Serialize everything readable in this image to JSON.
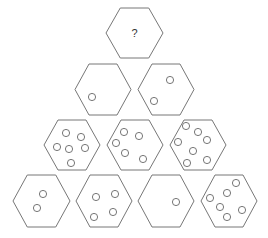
{
  "puzzle": {
    "question_mark": "?",
    "circle_radius": 3.6,
    "stroke_color": "#777777",
    "hexagons": [
      {
        "id": "top",
        "row": 1,
        "cx": 134.5,
        "cy": 33,
        "w": 57,
        "h": 50,
        "label": "?",
        "circles": []
      },
      {
        "id": "r2-1",
        "row": 2,
        "cx": 103,
        "cy": 89.5,
        "w": 56,
        "h": 51,
        "circles": [
          [
            92,
            97
          ]
        ]
      },
      {
        "id": "r2-2",
        "row": 2,
        "cx": 166,
        "cy": 89.5,
        "w": 56,
        "h": 51,
        "circles": [
          [
            170,
            80
          ],
          [
            154,
            101
          ]
        ]
      },
      {
        "id": "r3-1",
        "row": 3,
        "cx": 72,
        "cy": 145,
        "w": 56,
        "h": 50,
        "circles": [
          [
            66,
            133
          ],
          [
            81,
            137
          ],
          [
            57,
            147
          ],
          [
            69,
            149
          ],
          [
            85,
            148
          ],
          [
            71,
            163
          ]
        ]
      },
      {
        "id": "r3-2",
        "row": 3,
        "cx": 135,
        "cy": 145,
        "w": 56,
        "h": 50,
        "circles": [
          [
            124,
            132
          ],
          [
            139,
            136
          ],
          [
            116,
            143
          ],
          [
            125,
            153
          ],
          [
            143,
            159
          ]
        ]
      },
      {
        "id": "r3-3",
        "row": 3,
        "cx": 198,
        "cy": 145,
        "w": 56,
        "h": 50,
        "circles": [
          [
            186,
            126
          ],
          [
            198,
            132
          ],
          [
            207,
            140
          ],
          [
            178,
            142
          ],
          [
            193,
            151
          ],
          [
            207,
            160
          ],
          [
            187,
            163
          ]
        ]
      },
      {
        "id": "r4-1",
        "row": 4,
        "cx": 41.5,
        "cy": 201,
        "w": 57,
        "h": 52,
        "circles": [
          [
            43,
            194
          ],
          [
            37,
            208
          ]
        ]
      },
      {
        "id": "r4-2",
        "row": 4,
        "cx": 104,
        "cy": 201,
        "w": 56,
        "h": 52,
        "circles": [
          [
            96,
            197
          ],
          [
            115,
            194
          ],
          [
            94,
            217
          ],
          [
            113,
            212
          ]
        ]
      },
      {
        "id": "r4-3",
        "row": 4,
        "cx": 166,
        "cy": 201,
        "w": 56,
        "h": 52,
        "circles": [
          [
            176,
            202
          ]
        ]
      },
      {
        "id": "r4-4",
        "row": 4,
        "cx": 229,
        "cy": 201,
        "w": 56,
        "h": 52,
        "circles": [
          [
            236,
            183
          ],
          [
            227,
            193
          ],
          [
            210,
            198
          ],
          [
            220,
            207
          ],
          [
            242,
            210
          ],
          [
            227,
            217
          ]
        ]
      }
    ],
    "circle_counts": {
      "top": "?",
      "row2": [
        1,
        2
      ],
      "row3": [
        6,
        5,
        7
      ],
      "row4": [
        2,
        4,
        1,
        6
      ]
    }
  }
}
